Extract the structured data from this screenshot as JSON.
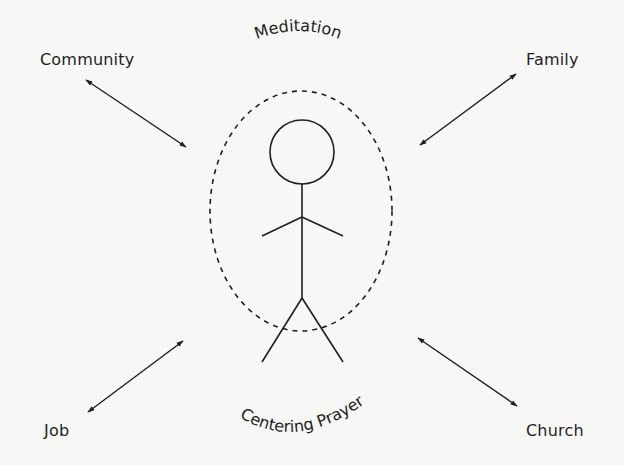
{
  "diagram": {
    "center": {
      "figure": "stick-figure",
      "boundary": "dashed-ellipse",
      "top_label": "Meditation",
      "bottom_label": "Centering Prayer"
    },
    "nodes": [
      {
        "id": "community",
        "label": "Community",
        "position": "top-left"
      },
      {
        "id": "family",
        "label": "Family",
        "position": "top-right"
      },
      {
        "id": "job",
        "label": "Job",
        "position": "bottom-left"
      },
      {
        "id": "church",
        "label": "Church",
        "position": "bottom-right"
      }
    ],
    "connectors": [
      {
        "from": "community",
        "to": "center",
        "type": "double-arrow"
      },
      {
        "from": "family",
        "to": "center",
        "type": "double-arrow"
      },
      {
        "from": "job",
        "to": "center",
        "type": "double-arrow"
      },
      {
        "from": "church",
        "to": "center",
        "type": "double-arrow"
      }
    ],
    "colors": {
      "ink": "#1f1f1f",
      "background": "#f7f7f5"
    }
  }
}
